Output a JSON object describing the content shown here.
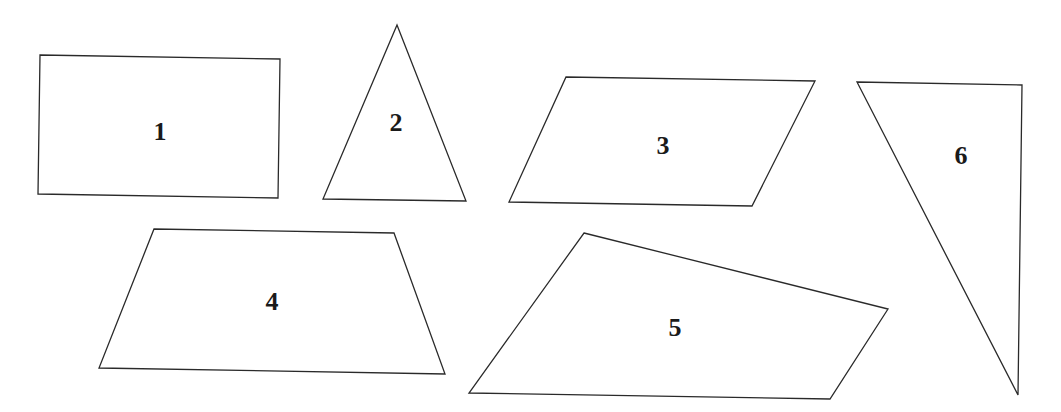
{
  "diagram": {
    "title": "",
    "shapes": [
      {
        "id": "1",
        "label": "1",
        "kind": "rectangle",
        "sides": 4
      },
      {
        "id": "2",
        "label": "2",
        "kind": "isosceles-triangle",
        "sides": 3
      },
      {
        "id": "3",
        "label": "3",
        "kind": "parallelogram",
        "sides": 4
      },
      {
        "id": "4",
        "label": "4",
        "kind": "trapezoid",
        "sides": 4
      },
      {
        "id": "5",
        "label": "5",
        "kind": "irregular-quadrilateral",
        "sides": 4
      },
      {
        "id": "6",
        "label": "6",
        "kind": "right-triangle",
        "sides": 3
      }
    ],
    "colors": {
      "stroke": "#2a2a2a",
      "fill": "#ffffff",
      "label": "#1a1a1a"
    }
  }
}
